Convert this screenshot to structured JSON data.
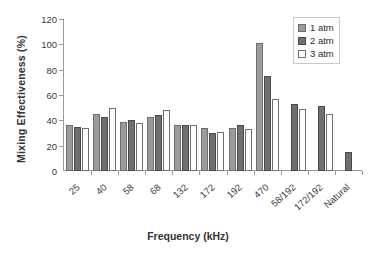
{
  "chart_data": {
    "type": "bar",
    "title": "",
    "xlabel": "Frequency (kHz)",
    "ylabel": "Mixing Effectiveness (%)",
    "ylim": [
      0,
      120
    ],
    "yticks": [
      0,
      20,
      40,
      60,
      80,
      100,
      120
    ],
    "grid": false,
    "legend_position": "top-right",
    "categories": [
      "25",
      "40",
      "58",
      "68",
      "132",
      "172",
      "192",
      "470",
      "58/192",
      "172/192",
      "Natural"
    ],
    "series": [
      {
        "name": "1 atm",
        "color": "#9b9b9b",
        "values": [
          36,
          45,
          39,
          43,
          36,
          34,
          34,
          101,
          null,
          null,
          null
        ]
      },
      {
        "name": "2 atm",
        "color": "#6f6f6f",
        "values": [
          35,
          43,
          40,
          44,
          36,
          30,
          36,
          75,
          53,
          51,
          15
        ]
      },
      {
        "name": "3 atm",
        "color": "#ffffff",
        "values": [
          34,
          50,
          38,
          48,
          36,
          31,
          33,
          57,
          49,
          45,
          null
        ]
      }
    ]
  },
  "legend": {
    "items": [
      {
        "label": "1 atm"
      },
      {
        "label": "2 atm"
      },
      {
        "label": "3 atm"
      }
    ]
  }
}
